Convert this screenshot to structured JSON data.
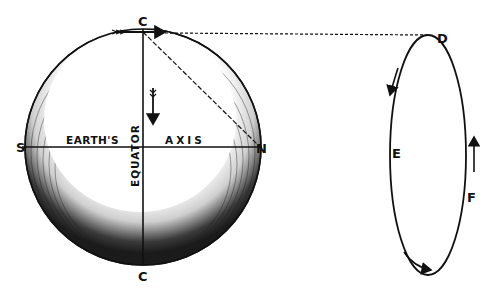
{
  "diagram": {
    "labels": {
      "c_top": "C",
      "c_bottom": "C",
      "s": "S",
      "n": "N",
      "d": "D",
      "e": "E",
      "f": "F",
      "earths": "EARTH'S",
      "axis": "AXIS",
      "equator": "EQUATOR"
    },
    "colors": {
      "ink": "#111111",
      "background": "#ffffff"
    }
  }
}
